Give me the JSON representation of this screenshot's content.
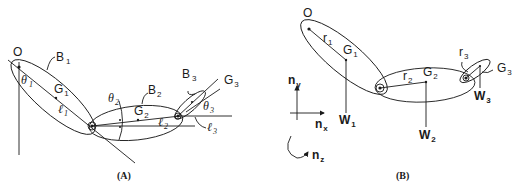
{
  "panel_a": {
    "caption": "(A)",
    "origin_label": "O",
    "bodies": [
      {
        "label": "B",
        "sub": "1"
      },
      {
        "label": "B",
        "sub": "2"
      },
      {
        "label": "B",
        "sub": "3"
      }
    ],
    "centers_of_mass": [
      {
        "label": "G",
        "sub": "1"
      },
      {
        "label": "G",
        "sub": "2"
      },
      {
        "label": "G",
        "sub": "3"
      }
    ],
    "angles": [
      {
        "label": "θ",
        "sub": "1"
      },
      {
        "label": "θ",
        "sub": "2"
      },
      {
        "label": "θ",
        "sub": "3"
      }
    ],
    "lengths": [
      {
        "label": "ℓ",
        "sub": "1"
      },
      {
        "label": "ℓ",
        "sub": "2"
      },
      {
        "label": "ℓ",
        "sub": "3"
      }
    ]
  },
  "panel_b": {
    "caption": "(B)",
    "origin_label": "O",
    "position_vectors": [
      {
        "label": "r",
        "sub": "1"
      },
      {
        "label": "r",
        "sub": "2"
      },
      {
        "label": "r",
        "sub": "3"
      }
    ],
    "centers_of_mass": [
      {
        "label": "G",
        "sub": "1"
      },
      {
        "label": "G",
        "sub": "2"
      },
      {
        "label": "G",
        "sub": "3"
      }
    ],
    "weights": [
      {
        "label": "W",
        "sub": "1"
      },
      {
        "label": "W",
        "sub": "2"
      },
      {
        "label": "W",
        "sub": "3"
      }
    ],
    "axes": [
      {
        "label": "n",
        "sub": "y"
      },
      {
        "label": "n",
        "sub": "x"
      },
      {
        "label": "n",
        "sub": "z"
      }
    ]
  }
}
